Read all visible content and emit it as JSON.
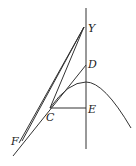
{
  "diagram": {
    "labels": {
      "Y": "Y",
      "D": "D",
      "E": "E",
      "C": "C",
      "F": "F"
    },
    "points": {
      "Y": [
        84,
        27
      ],
      "D": [
        86,
        65
      ],
      "E": [
        86,
        108
      ],
      "C": [
        50,
        108
      ],
      "F": [
        20,
        142
      ],
      "peak": [
        86,
        82
      ]
    },
    "stroke_color": "#333333",
    "background": "#ffffff"
  }
}
